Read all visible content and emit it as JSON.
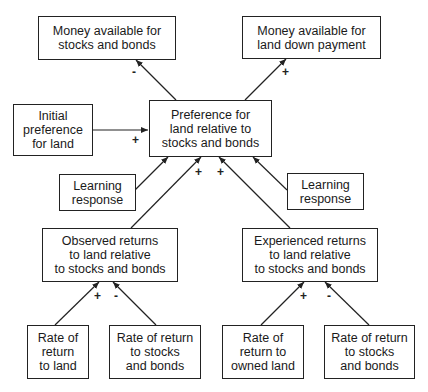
{
  "diagram": {
    "type": "causal-loop",
    "nodes": [
      {
        "id": "money_stocks",
        "label": "Money available for\nstocks and bonds"
      },
      {
        "id": "money_land",
        "label": "Money available for\nland down payment"
      },
      {
        "id": "initial_pref",
        "label": "Initial\npreference\nfor land"
      },
      {
        "id": "preference",
        "label": "Preference for\nland relative to\nstocks and bonds"
      },
      {
        "id": "learning_left",
        "label": "Learning\nresponse"
      },
      {
        "id": "learning_right",
        "label": "Learning\nresponse"
      },
      {
        "id": "observed",
        "label": "Observed returns\nto land relative\nto stocks and bonds"
      },
      {
        "id": "experienced",
        "label": "Experienced returns\nto land relative\nto stocks and bonds"
      },
      {
        "id": "rate_land",
        "label": "Rate of\nreturn\nto land"
      },
      {
        "id": "rate_stocks_left",
        "label": "Rate of return\nto stocks\nand bonds"
      },
      {
        "id": "rate_owned_land",
        "label": "Rate of\nreturn to\nowned land"
      },
      {
        "id": "rate_stocks_right",
        "label": "Rate of return\nto stocks\nand bonds"
      }
    ],
    "edges": [
      {
        "from": "preference",
        "to": "money_stocks",
        "sign": "-"
      },
      {
        "from": "preference",
        "to": "money_land",
        "sign": "+"
      },
      {
        "from": "initial_pref",
        "to": "preference",
        "sign": "+"
      },
      {
        "from": "learning_left",
        "to": "preference",
        "sign": ""
      },
      {
        "from": "observed",
        "to": "preference",
        "sign": "+"
      },
      {
        "from": "experienced",
        "to": "preference",
        "sign": "+"
      },
      {
        "from": "learning_right",
        "to": "preference",
        "sign": ""
      },
      {
        "from": "rate_land",
        "to": "observed",
        "sign": "+"
      },
      {
        "from": "rate_stocks_left",
        "to": "observed",
        "sign": "-"
      },
      {
        "from": "rate_owned_land",
        "to": "experienced",
        "sign": "+"
      },
      {
        "from": "rate_stocks_right",
        "to": "experienced",
        "sign": "-"
      }
    ]
  },
  "signs": {
    "pref_to_money_stocks": "-",
    "pref_to_money_land": "+",
    "initial_to_pref": "+",
    "observed_to_pref": "+",
    "experienced_to_pref": "+",
    "rate_land_to_observed": "+",
    "rate_stocks_to_observed": "-",
    "rate_owned_to_experienced": "+",
    "rate_stocks_to_experienced": "-"
  }
}
